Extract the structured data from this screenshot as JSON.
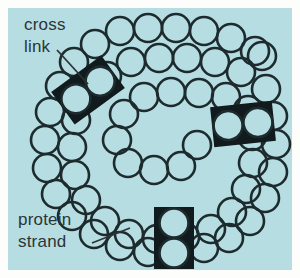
{
  "figure": {
    "panel_background_color": "#b6dde1",
    "page_background_color": "#fdfdfb",
    "strand_outline_color": "#1d2b2e",
    "crosslink_fill_color": "#111a1c",
    "label_text_color": "#2d3436"
  },
  "labels": [
    {
      "id": "cross-link",
      "line1": "cross",
      "line2": "link",
      "x": 24,
      "y": 30,
      "leader": {
        "x1": 57,
        "y1": 50,
        "x2": 88,
        "y2": 84
      }
    },
    {
      "id": "protein-strand",
      "line1": "protein",
      "line2": "strand",
      "x": 18,
      "y": 225,
      "leader": {
        "x1": 92,
        "y1": 243,
        "x2": 130,
        "y2": 228
      }
    }
  ],
  "crosslinks": [
    {
      "id": "crosslink-upper-left",
      "cx": 88,
      "cy": 90,
      "rotation": -36,
      "orientation": "horizontal"
    },
    {
      "id": "crosslink-right",
      "cx": 243,
      "cy": 124,
      "rotation": -6,
      "orientation": "horizontal"
    },
    {
      "id": "crosslink-bottom",
      "cx": 174,
      "cy": 238,
      "rotation": 0,
      "orientation": "vertical"
    }
  ],
  "strands": [
    {
      "id": "protein-strand-outer",
      "bead_count": 44,
      "description": "outer spiral chain of protein subunits"
    },
    {
      "id": "protein-strand-inner",
      "bead_count": 32,
      "description": "inner spiral chain of protein subunits"
    }
  ],
  "geometry": {
    "panel": {
      "x": 8,
      "y": 8,
      "width": 284,
      "height": 262
    },
    "bead_radius": 14,
    "bead_stroke_width": 2.6
  }
}
